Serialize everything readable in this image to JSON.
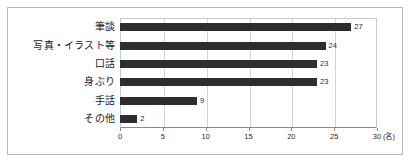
{
  "chart_data": {
    "type": "bar",
    "orientation": "horizontal",
    "title": "",
    "xlabel": "(名)",
    "ylabel": "",
    "categories": [
      "筆談",
      "写真・イラスト等",
      "口話",
      "身ぶり",
      "手話",
      "その他"
    ],
    "values": [
      27,
      24,
      23,
      23,
      9,
      2
    ],
    "value_labels": [
      "27",
      "24",
      "23",
      "23",
      "9",
      "2"
    ],
    "xlim": [
      0,
      30
    ],
    "xticks": [
      0,
      5,
      10,
      15,
      20,
      25,
      30
    ],
    "xtick_labels": [
      "0",
      "5",
      "10",
      "15",
      "20",
      "25",
      "30"
    ],
    "grid": true,
    "grid_axis": "x",
    "legend": false,
    "bar_color": "#2e2e2e",
    "grid_color": "#d2d2d2",
    "axis_color": "#8a8a8a",
    "frame_color": "#b9b9b9",
    "background_color": "#ffffff",
    "text_color": "#1a1a1a"
  }
}
